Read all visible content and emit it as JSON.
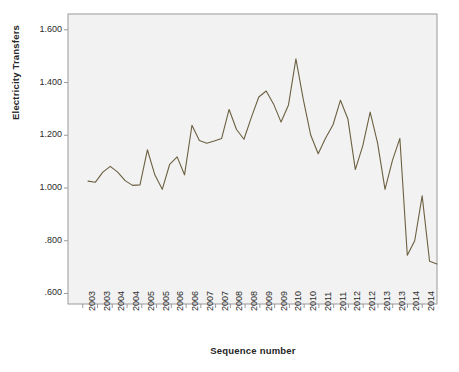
{
  "chart_data": {
    "type": "line",
    "title": "",
    "xlabel": "Sequence number",
    "ylabel": "Electricity Transfers",
    "ylim": [
      0.56,
      1.66
    ],
    "yticks": [
      0.6,
      0.8,
      1.0,
      1.2,
      1.4,
      1.6
    ],
    "ytick_labels": [
      ".600",
      ".800",
      "1.000",
      "1.200",
      "1.400",
      "1.600"
    ],
    "xtick_labels": [
      "2003",
      "2003",
      "2004",
      "2004",
      "2005",
      "2005",
      "2006",
      "2006",
      "2007",
      "2007",
      "2008",
      "2008",
      "2009",
      "2009",
      "2010",
      "2010",
      "2011",
      "2011",
      "2012",
      "2012",
      "2013",
      "2013",
      "2014",
      "2014"
    ],
    "grid": false,
    "legend": false,
    "line_color": "#6b6040",
    "plot_bg": "#f2f2f2",
    "frame_color": "#9a9a9a",
    "series": [
      {
        "name": "Electricity Transfers",
        "x": [
          1,
          2,
          3,
          4,
          5,
          6,
          7,
          8,
          9,
          10,
          11,
          12,
          13,
          14,
          15,
          16,
          17,
          18,
          19,
          20,
          21,
          22,
          23,
          24,
          25,
          26,
          27,
          28,
          29,
          30,
          31,
          32,
          33,
          34,
          35,
          36,
          37,
          38,
          39,
          40,
          41,
          42,
          43,
          44,
          45,
          46,
          47,
          48
        ],
        "values": [
          1.026,
          1.022,
          1.06,
          1.082,
          1.06,
          1.028,
          1.01,
          1.012,
          1.145,
          1.05,
          0.995,
          1.09,
          1.118,
          1.05,
          1.238,
          1.18,
          1.17,
          1.178,
          1.188,
          1.298,
          1.222,
          1.185,
          1.268,
          1.345,
          1.368,
          1.318,
          1.25,
          1.315,
          1.49,
          1.335,
          1.2,
          1.13,
          1.19,
          1.24,
          1.333,
          1.262,
          1.07,
          1.16,
          1.288,
          1.17,
          0.995,
          1.105,
          1.188,
          0.745,
          0.8,
          0.97,
          0.722,
          0.712
        ]
      }
    ],
    "annotations": []
  },
  "axes": {
    "y_title": "Electricity Transfers",
    "x_title": "Sequence number",
    "y_tick_labels": [
      "1.600",
      "1.400",
      "1.200",
      "1.000",
      ".800",
      ".600"
    ],
    "x_tick_labels": [
      "2003",
      "2003",
      "2004",
      "2004",
      "2005",
      "2005",
      "2006",
      "2006",
      "2007",
      "2007",
      "2008",
      "2008",
      "2009",
      "2009",
      "2010",
      "2010",
      "2011",
      "2011",
      "2012",
      "2012",
      "2013",
      "2013",
      "2014",
      "2014"
    ]
  }
}
